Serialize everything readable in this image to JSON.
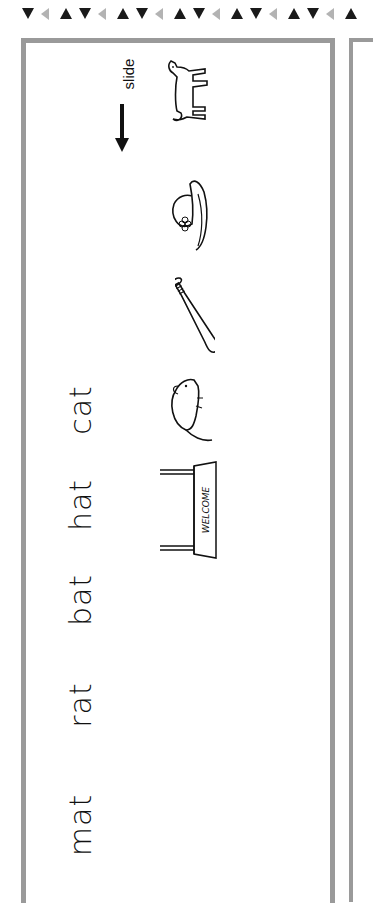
{
  "worksheet": {
    "border_pattern": [
      "down",
      "left",
      "up"
    ],
    "border_colors": {
      "dark": "#1a1a1a",
      "light": "#b3b3b3",
      "frame": "#9a9a9a"
    },
    "instruction": {
      "label": "slide",
      "arrow": "arrow-down"
    },
    "words": [
      {
        "text": "cat",
        "y": 410
      },
      {
        "text": "hat",
        "y": 505
      },
      {
        "text": "bat",
        "y": 600
      },
      {
        "text": "rat",
        "y": 705
      },
      {
        "text": "mat",
        "y": 825
      }
    ],
    "pictures": [
      {
        "name": "cat",
        "y": 92
      },
      {
        "name": "hat",
        "y": 215
      },
      {
        "name": "bat",
        "y": 315
      },
      {
        "name": "rat",
        "y": 410
      },
      {
        "name": "welcome-mat",
        "text": "WELCOME",
        "y": 510
      }
    ]
  }
}
